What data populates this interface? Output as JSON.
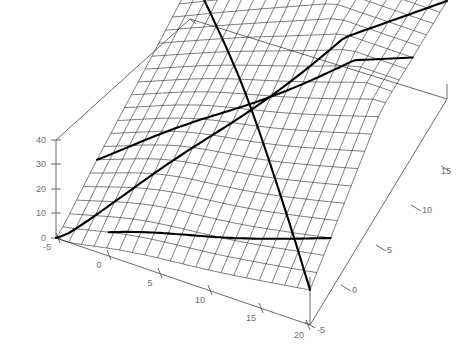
{
  "figure": {
    "title": "",
    "background_color": "#ffffff",
    "line_color": "#111111",
    "bold_line_color": "#000000",
    "axis_color": "#5a5a5a",
    "label_color": "#6e6e6e"
  },
  "chart_data": {
    "type": "surface",
    "title": "",
    "xlabel": "",
    "ylabel": "",
    "zlabel": "",
    "xlim": [
      -5,
      20
    ],
    "ylim": [
      -5,
      15
    ],
    "zlim": [
      0,
      40
    ],
    "grid": true,
    "legend": "none",
    "projection": "3d-wireframe",
    "mesh": {
      "nx": 21,
      "ny": 21
    },
    "z_axis": {
      "ticks": [
        0,
        10,
        20,
        30,
        40
      ],
      "tick_labels": [
        "0",
        "10",
        "20",
        "30",
        "40"
      ]
    },
    "x_axis": {
      "ticks": [
        -5,
        0,
        5,
        10,
        15,
        20
      ],
      "tick_labels": [
        "-5",
        "0",
        "5",
        "10",
        "15",
        "20"
      ]
    },
    "y_axis": {
      "ticks": [
        -5,
        0,
        5,
        10,
        15
      ],
      "tick_labels": [
        "-5",
        "0",
        "5",
        "10",
        "15"
      ]
    },
    "bold_curves": 4
  },
  "labels": {
    "z": [
      "40",
      "30",
      "20",
      "10",
      "0"
    ],
    "x": [
      "-5",
      "0",
      "5",
      "10",
      "15",
      "20"
    ],
    "y": [
      "-5",
      "0",
      "5",
      "10",
      "15"
    ]
  }
}
